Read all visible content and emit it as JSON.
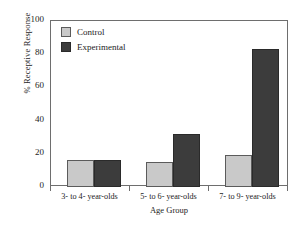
{
  "chart_data": {
    "type": "bar",
    "title": "",
    "xlabel": "Age Group",
    "ylabel": "% Receptive Response",
    "categories": [
      "3- to 4- year-olds",
      "5- to 6- year-olds",
      "7- to 9- year-olds"
    ],
    "series": [
      {
        "name": "Control",
        "values": [
          16,
          15,
          19
        ],
        "color": "#c9c9c9"
      },
      {
        "name": "Experimental",
        "values": [
          16,
          32,
          83
        ],
        "color": "#3c3c3c"
      }
    ],
    "ylim": [
      0,
      100
    ],
    "yticks": [
      0,
      20,
      40,
      60,
      80,
      100
    ],
    "ytick_labels": [
      "0",
      "20",
      "40",
      "60",
      "80",
      "100"
    ],
    "grid": false,
    "legend_position": "top-left"
  },
  "legend": {
    "entries": [
      {
        "label": "Control",
        "swatch": "control"
      },
      {
        "label": "Experimental",
        "swatch": "experimental"
      }
    ]
  },
  "axes": {
    "y_title": "% Receptive Response",
    "x_title": "Age Group"
  }
}
